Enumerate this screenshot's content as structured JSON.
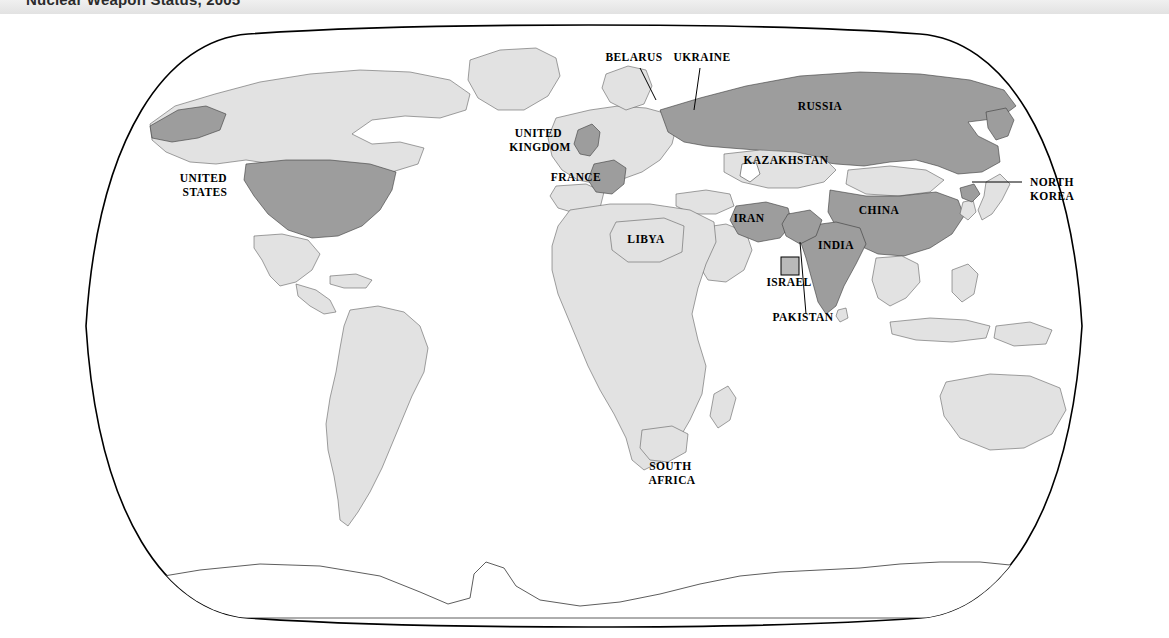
{
  "header": {
    "title": "Nuclear Weapon Status, 2005"
  },
  "map": {
    "projection": "Robinson",
    "type": "choropleth-world-map",
    "ocean_color": "#ffffff",
    "frame_color": "#000000",
    "legend": {
      "nuclear_color": "#9d9d9d",
      "other_color": "#e2e2e2",
      "israel_swatch_color": "#b9b9b9"
    },
    "labels": [
      {
        "id": "united-states",
        "text": "UNITED\nSTATES",
        "line1": "UNITED",
        "line2": "STATES",
        "x": 205,
        "y": 168,
        "anchor": "middle",
        "leader": false
      },
      {
        "id": "united-kingdom",
        "text": "UNITED\nKINGDOM",
        "line1": "UNITED",
        "line2": "KINGDOM",
        "x": 540,
        "y": 123,
        "anchor": "middle",
        "leader": false
      },
      {
        "id": "france",
        "text": "FRANCE",
        "line1": "FRANCE",
        "line2": "",
        "x": 576,
        "y": 167,
        "anchor": "middle",
        "leader": false
      },
      {
        "id": "belarus",
        "text": "BELARUS",
        "line1": "BELARUS",
        "line2": "",
        "x": 634,
        "y": 47,
        "anchor": "middle",
        "leader": true
      },
      {
        "id": "ukraine",
        "text": "UKRAINE",
        "line1": "UKRAINE",
        "line2": "",
        "x": 700,
        "y": 47,
        "anchor": "middle",
        "leader": true
      },
      {
        "id": "russia",
        "text": "RUSSIA",
        "line1": "RUSSIA",
        "line2": "",
        "x": 820,
        "y": 96,
        "anchor": "middle",
        "leader": false
      },
      {
        "id": "kazakhstan",
        "text": "KAZAKHSTAN",
        "line1": "KAZAKHSTAN",
        "line2": "",
        "x": 786,
        "y": 150,
        "anchor": "middle",
        "leader": false
      },
      {
        "id": "china",
        "text": "CHINA",
        "line1": "CHINA",
        "line2": "",
        "x": 879,
        "y": 200,
        "anchor": "middle",
        "leader": false
      },
      {
        "id": "north-korea",
        "text": "NORTH\nKOREA",
        "line1": "NORTH",
        "line2": "KOREA",
        "x": 1030,
        "y": 172,
        "anchor": "start",
        "leader": true
      },
      {
        "id": "iran",
        "text": "IRAN",
        "line1": "IRAN",
        "line2": "",
        "x": 749,
        "y": 208,
        "anchor": "middle",
        "leader": false
      },
      {
        "id": "india",
        "text": "INDIA",
        "line1": "INDIA",
        "line2": "",
        "x": 836,
        "y": 235,
        "anchor": "middle",
        "leader": false
      },
      {
        "id": "israel",
        "text": "ISRAEL",
        "line1": "ISRAEL",
        "line2": "",
        "x": 789,
        "y": 272,
        "anchor": "middle",
        "leader": false
      },
      {
        "id": "pakistan",
        "text": "PAKISTAN",
        "line1": "PAKISTAN",
        "line2": "",
        "x": 803,
        "y": 307,
        "anchor": "middle",
        "leader": true
      },
      {
        "id": "libya",
        "text": "LIBYA",
        "line1": "LIBYA",
        "line2": "",
        "x": 646,
        "y": 229,
        "anchor": "middle",
        "leader": false
      },
      {
        "id": "south-africa",
        "text": "SOUTH\nAFRICA",
        "line1": "SOUTH",
        "line2": "AFRICA",
        "x": 672,
        "y": 456,
        "anchor": "middle",
        "leader": false
      }
    ],
    "nuclear_states": [
      "United States",
      "United Kingdom",
      "France",
      "Russia",
      "China",
      "India",
      "Pakistan",
      "Israel",
      "North Korea",
      "Iran"
    ],
    "former_or_renounced": [
      "Belarus",
      "Ukraine",
      "Kazakhstan",
      "Libya",
      "South Africa"
    ]
  }
}
